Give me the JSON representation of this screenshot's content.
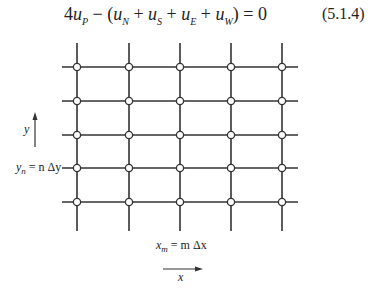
{
  "equation": {
    "coefficient": "4",
    "terms": [
      {
        "var": "u",
        "sub": "P"
      },
      {
        "var": "u",
        "sub": "N"
      },
      {
        "var": "u",
        "sub": "S"
      },
      {
        "var": "u",
        "sub": "E"
      },
      {
        "var": "u",
        "sub": "W"
      }
    ],
    "text": "4u_P − (u_N + u_S + u_E + u_W) = 0",
    "number": "(5.1.4)"
  },
  "diagram": {
    "type": "finite-difference grid",
    "columns_x": [
      77,
      129,
      180,
      231,
      282
    ],
    "rows_y": [
      67,
      101,
      135,
      168,
      202
    ],
    "line_color": "#333333",
    "node_style": "open-circle",
    "y_axis_label": "y",
    "x_axis_label": "x",
    "row_label": {
      "lhs": "y",
      "lhs_sub": "n",
      "rhs": "= n Δy"
    },
    "col_label": {
      "lhs": "x",
      "lhs_sub": "m",
      "rhs": "= m Δx"
    }
  }
}
